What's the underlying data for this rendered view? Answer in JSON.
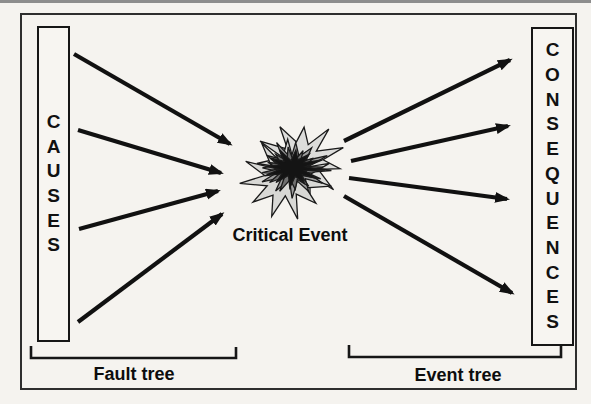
{
  "causes": {
    "label": "CAUSES",
    "letters": [
      "C",
      "A",
      "U",
      "S",
      "E",
      "S"
    ]
  },
  "consequences": {
    "label": "CONSEQUENCES",
    "letters": [
      "C",
      "O",
      "N",
      "S",
      "E",
      "Q",
      "U",
      "E",
      "N",
      "C",
      "E",
      "S"
    ]
  },
  "critical_event": {
    "label": "Critical Event"
  },
  "fault_tree": {
    "label": "Fault tree"
  },
  "event_tree": {
    "label": "Event tree"
  },
  "arrows": {
    "causes_to_event_count": 4,
    "event_to_consequences_count": 4
  },
  "colors": {
    "paper": "#f5f3ef",
    "ink": "#111111",
    "frame": "#2e2e2e",
    "top_rule": "#8d8d8d",
    "starburst_layers": [
      "#dcdcda",
      "#d8d8d5",
      "#9e9e9e",
      "#6f6f6f",
      "#141414"
    ]
  }
}
